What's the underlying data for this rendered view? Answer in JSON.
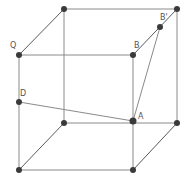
{
  "diagram": {
    "type": "cube-wireframe",
    "colors": {
      "edge": "#8a8a8a",
      "segment": "#5a5a5a",
      "vertex": "#3a3a3a",
      "label": "#555555"
    },
    "labels": {
      "Q": "Q",
      "B": "B",
      "B_prime": "B'",
      "D": "D",
      "A": "A"
    },
    "vertices": {
      "top_back_left": [
        64,
        9
      ],
      "top_back_right": [
        177,
        9
      ],
      "top_front_left_Q": [
        19,
        55
      ],
      "top_front_right_B": [
        133,
        55
      ],
      "bottom_back_left": [
        64,
        123
      ],
      "bottom_back_right": [
        177,
        123
      ],
      "bottom_front_left": [
        19,
        170
      ],
      "bottom_front_right": [
        133,
        170
      ],
      "point_B_prime": [
        160,
        27
      ],
      "point_D": [
        19,
        102
      ],
      "point_A": [
        133,
        121
      ]
    }
  }
}
